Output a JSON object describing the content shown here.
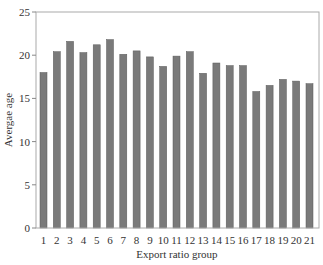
{
  "chart_data": {
    "type": "bar",
    "title": "",
    "xlabel": "Export ratio group",
    "ylabel": "Avergae age",
    "ylim": [
      0,
      25
    ],
    "yticks": [
      0,
      5,
      10,
      15,
      20,
      25
    ],
    "grid": false,
    "legend": null,
    "categories": [
      "1",
      "2",
      "3",
      "4",
      "5",
      "6",
      "7",
      "8",
      "9",
      "10",
      "11",
      "12",
      "13",
      "14",
      "15",
      "16",
      "17",
      "18",
      "19",
      "20",
      "21"
    ],
    "values": [
      18.0,
      20.4,
      21.6,
      20.3,
      21.2,
      21.8,
      20.1,
      20.5,
      19.8,
      18.7,
      19.9,
      20.4,
      17.9,
      19.1,
      18.8,
      18.8,
      15.8,
      16.5,
      17.2,
      17.0,
      16.7
    ],
    "colors": {
      "bar": "#7a7a7a",
      "bar_edge": "#5a5a5a",
      "frame": "#aaaaaa"
    }
  }
}
